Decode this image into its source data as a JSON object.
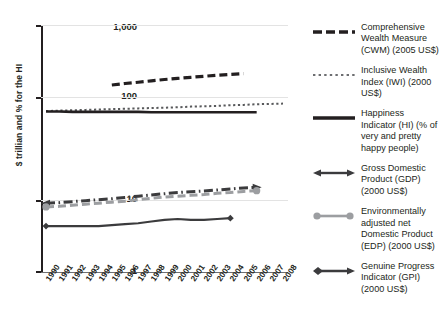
{
  "chart_data": {
    "type": "line",
    "title": "",
    "xlabel": "",
    "ylabel": "$ trillian and % for the HI",
    "yscale": "log",
    "ylim": [
      1,
      1000
    ],
    "ytick_labels": [
      "1,000",
      "100",
      "10",
      "1"
    ],
    "grid": true,
    "legend_position": "right",
    "x": [
      1990,
      1991,
      1992,
      1993,
      1994,
      1995,
      1996,
      1997,
      1998,
      1999,
      2000,
      2001,
      2002,
      2003,
      2004,
      2005,
      2006,
      2007,
      2008
    ],
    "categories": [
      "1990",
      "1991",
      "1992",
      "1993",
      "1994",
      "1995",
      "1996",
      "1997",
      "1998",
      "1999",
      "2000",
      "2001",
      "2002",
      "2003",
      "2004",
      "2005",
      "2006",
      "2007",
      "2008"
    ],
    "series": [
      {
        "name": "Comprehensive Wealth Measure (CWM) (2005 US$)",
        "short": "CWM",
        "style": "dashed",
        "color": "#231f20",
        "x": [
          1995,
          1996,
          1997,
          1998,
          1999,
          2000,
          2001,
          2002,
          2003,
          2004,
          2005
        ],
        "values": [
          188,
          196,
          203,
          211,
          219,
          226,
          233,
          240,
          247,
          253,
          258
        ]
      },
      {
        "name": "Inclusive Wealth Index (IWI) (2000 US$)",
        "short": "IWI",
        "style": "dotted",
        "color": "#58595b",
        "x": [
          1990,
          1991,
          1992,
          1993,
          1994,
          1995,
          1996,
          1997,
          1998,
          1999,
          2000,
          2001,
          2002,
          2003,
          2004,
          2005,
          2006,
          2007,
          2008
        ],
        "values": [
          91,
          92,
          93,
          94,
          95,
          96,
          97,
          98,
          99,
          100,
          101,
          103,
          104,
          105,
          107,
          108,
          110,
          111,
          112
        ]
      },
      {
        "name": "Happiness Indicator (HI) (% of very and pretty happy people)",
        "short": "HI",
        "style": "solid",
        "color": "#231f20",
        "x": [
          1990,
          1991,
          1992,
          1993,
          1994,
          1995,
          1996,
          1997,
          1998,
          1999,
          2000,
          2001,
          2002,
          2003,
          2004,
          2005,
          2006
        ],
        "values": [
          90,
          90,
          89,
          89,
          89,
          89,
          89,
          89,
          88,
          88,
          88,
          88,
          88,
          88,
          88,
          88,
          88
        ]
      },
      {
        "name": "Gross Domestic Product (GDP) (2000 US$)",
        "short": "GDP",
        "style": "dash-dot",
        "color": "#3b3b3d",
        "x": [
          1990,
          1991,
          1992,
          1993,
          1994,
          1995,
          1996,
          1997,
          1998,
          1999,
          2000,
          2001,
          2002,
          2003,
          2004,
          2005,
          2006
        ],
        "values": [
          7.0,
          7.1,
          7.3,
          7.5,
          7.7,
          7.9,
          8.2,
          8.5,
          8.8,
          9.1,
          9.4,
          9.6,
          9.8,
          10.1,
          10.4,
          10.7,
          10.9
        ]
      },
      {
        "name": "Environmentally adjusted net Domestic Product (EDP) (2000 US$)",
        "short": "EDP",
        "style": "dashed-grey",
        "color": "#9c9ea1",
        "x": [
          1990,
          1991,
          1992,
          1993,
          1994,
          1995,
          1996,
          1997,
          1998,
          1999,
          2000,
          2001,
          2002,
          2003,
          2004,
          2005,
          2006
        ],
        "values": [
          6.3,
          6.4,
          6.6,
          6.8,
          7.0,
          7.2,
          7.4,
          7.7,
          8.0,
          8.3,
          8.5,
          8.7,
          8.9,
          9.2,
          9.4,
          9.7,
          9.9
        ]
      },
      {
        "name": "Genuine Progress Indicator (GPI) (2000 US$)",
        "short": "GPI",
        "style": "solid-marker",
        "color": "#3b3b3d",
        "x": [
          1990,
          1991,
          1992,
          1993,
          1994,
          1995,
          1996,
          1997,
          1998,
          1999,
          2000,
          2001,
          2002,
          2003,
          2004
        ],
        "values": [
          3.7,
          3.7,
          3.7,
          3.7,
          3.7,
          3.8,
          3.9,
          4.0,
          4.2,
          4.4,
          4.5,
          4.4,
          4.4,
          4.5,
          4.6
        ]
      }
    ]
  },
  "axis": {
    "y_title": "$ trillian and % for the HI",
    "y_ticks": [
      "1,000",
      "100",
      "10",
      "1"
    ],
    "x_ticks": [
      "1990",
      "1991",
      "1992",
      "1993",
      "1994",
      "1995",
      "1996",
      "1997",
      "1998",
      "1999",
      "2000",
      "2001",
      "2002",
      "2003",
      "2004",
      "2005",
      "2006",
      "2007",
      "2008"
    ]
  },
  "legend": {
    "items": [
      {
        "label": "Comprehensive Wealth Measure (CWM) (2005 US$)",
        "swatch": "dashed-line-icon"
      },
      {
        "label": "Inclusive Wealth Index (IWI) (2000 US$)",
        "swatch": "dotted-line-icon"
      },
      {
        "label": "Happiness Indicator (HI) (% of very and pretty happy people)",
        "swatch": "solid-line-icon"
      },
      {
        "label": "Gross Domestic Product (GDP) (2000 US$)",
        "swatch": "double-arrow-line-icon"
      },
      {
        "label": "Environmentally adjusted net Domestic Product (EDP) (2000 US$)",
        "swatch": "grey-dot-line-icon"
      },
      {
        "label": "Genuine Progress Indicator (GPI) (2000 US$)",
        "swatch": "diamond-arrow-line-icon"
      }
    ]
  },
  "colors": {
    "ink": "#231f20",
    "grey_mid": "#58595b",
    "grey_light": "#9c9ea1",
    "grid": "#e3e3e3",
    "background": "#ffffff"
  }
}
